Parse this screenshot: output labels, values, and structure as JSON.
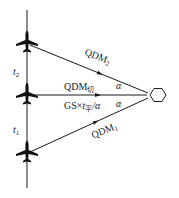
{
  "diagram": {
    "type": "aircraft-station-bearing-geometry",
    "colors": {
      "stroke": "#1a1a1a",
      "background": "#ffffff"
    },
    "station": {
      "shape": "hexagon",
      "icon": "navaid-station-icon"
    },
    "aircraft": [
      {
        "id": "aircraft-top",
        "icon": "airplane-icon"
      },
      {
        "id": "aircraft-middle",
        "icon": "airplane-icon"
      },
      {
        "id": "aircraft-bottom",
        "icon": "airplane-icon"
      }
    ],
    "labels": {
      "qdm2_main": "QDM",
      "qdm2_sub": "2",
      "qdm_tangent_main": "QDM",
      "qdm_tangent_sub": "切",
      "alpha_upper": "α",
      "alpha_lower": "α",
      "gs_formula_prefix": "GS×",
      "gs_formula_t": "t",
      "gs_formula_t_sub": "平",
      "gs_formula_suffix": "/α",
      "qdm1_main": "QDM",
      "qdm1_sub": "1",
      "t2_main": "t",
      "t2_sub": "2",
      "t1_main": "t",
      "t1_sub": "1"
    }
  }
}
